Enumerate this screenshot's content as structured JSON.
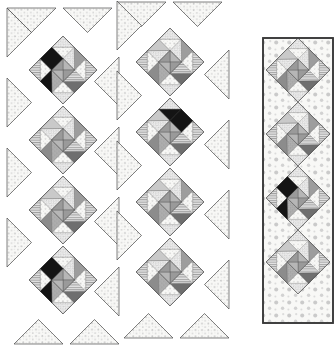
{
  "figure": {
    "type": "quilt-pattern-diagram",
    "title": "",
    "canvas": {
      "width": 336,
      "height": 352,
      "background": "#ffffff"
    }
  },
  "palette": {
    "background": "#ffffff",
    "outline": "#3a3a3a",
    "outline_light": "#6d6d6d",
    "dotted_base": "#f7f7f5",
    "dotted_spot": "#c9c9c9",
    "light_gray": "#d8d8d8",
    "mid_gray": "#a8a8a8",
    "mid_dark_gray": "#8a8a8a",
    "dark_gray": "#6a6a6a",
    "black": "#141414",
    "speckle_base": "#efefef",
    "speckle_mark": "#9a9a9a"
  },
  "columns": [
    {
      "name": "column-one",
      "label": "Strip 1",
      "framed": false,
      "x_center": 63,
      "block_size": 68,
      "blocks": [
        {
          "index": 0,
          "cy": 70,
          "black_arm": "sw"
        },
        {
          "index": 1,
          "cy": 140,
          "black_arm": "none"
        },
        {
          "index": 2,
          "cy": 210,
          "black_arm": "none"
        },
        {
          "index": 3,
          "cy": 280,
          "black_arm": "sw"
        }
      ]
    },
    {
      "name": "column-two",
      "label": "Strip 2",
      "framed": false,
      "x_center": 170,
      "block_size": 68,
      "blocks": [
        {
          "index": 0,
          "cy": 62,
          "black_arm": "none"
        },
        {
          "index": 1,
          "cy": 132,
          "black_arm": "nw"
        },
        {
          "index": 2,
          "cy": 202,
          "black_arm": "none"
        },
        {
          "index": 3,
          "cy": 272,
          "black_arm": "none"
        }
      ]
    },
    {
      "name": "column-three",
      "label": "Strip 3",
      "framed": true,
      "x_center": 298,
      "block_size": 64,
      "frame": {
        "x": 263,
        "y": 38,
        "width": 70,
        "height": 285
      },
      "blocks": [
        {
          "index": 0,
          "cy": 70,
          "black_arm": "none"
        },
        {
          "index": 1,
          "cy": 134,
          "black_arm": "none"
        },
        {
          "index": 2,
          "cy": 198,
          "black_arm": "sw"
        },
        {
          "index": 3,
          "cy": 262,
          "black_arm": "none"
        }
      ]
    }
  ],
  "block_definition": {
    "name": "pinwheel-star-block",
    "center": "quarter-square-triangle-x",
    "arms": 4,
    "arm_shades": [
      "mid_gray",
      "dark_gray",
      "mid_dark_gray",
      "light_gray"
    ],
    "corner_units": "half-square-triangles-with-speckle"
  },
  "legend": {
    "visible": false,
    "entries": []
  }
}
